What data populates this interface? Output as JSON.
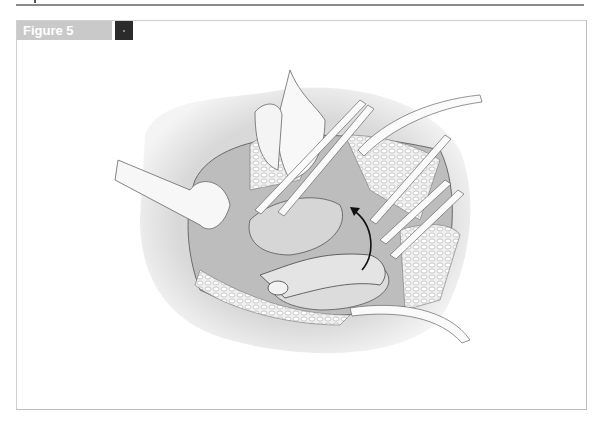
{
  "figure": {
    "label": "Figure 5"
  }
}
